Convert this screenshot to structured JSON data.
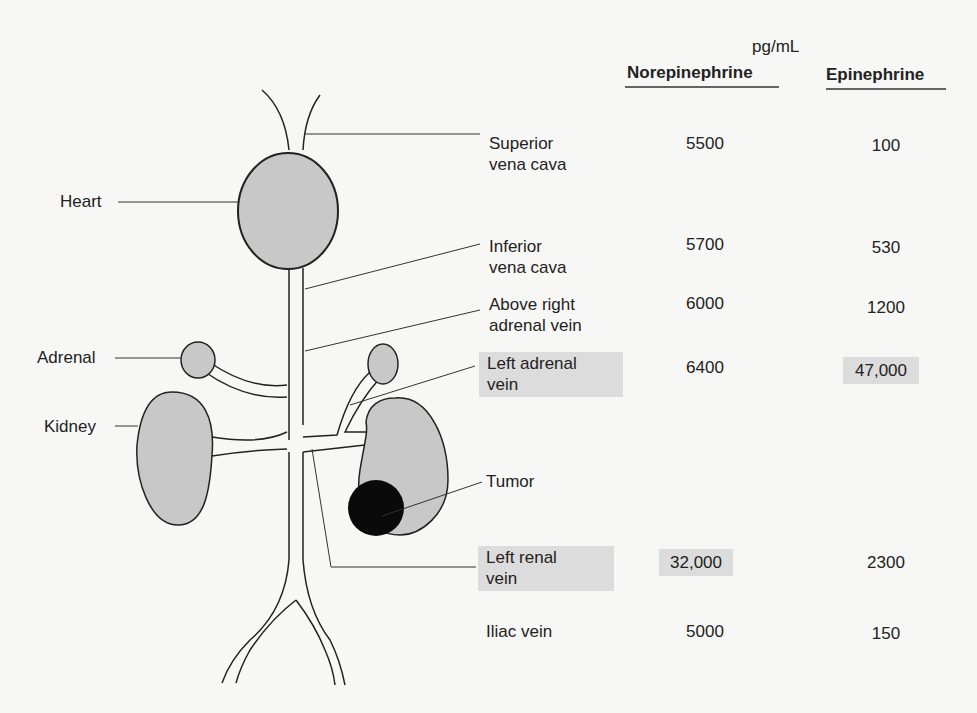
{
  "units": "pg/mL",
  "columns": [
    "Norepinephrine",
    "Epinephrine"
  ],
  "organ_labels": {
    "heart": "Heart",
    "adrenal": "Adrenal",
    "kidney": "Kidney",
    "tumor": "Tumor"
  },
  "rows": [
    {
      "site": "Superior vena cava",
      "site_l1": "Superior",
      "site_l2": "vena cava",
      "norepinephrine": "5500",
      "epinephrine": "100",
      "highlight_site": false,
      "highlight_ne": false,
      "highlight_epi": false
    },
    {
      "site": "Inferior vena cava",
      "site_l1": "Inferior",
      "site_l2": "vena cava",
      "norepinephrine": "5700",
      "epinephrine": "530",
      "highlight_site": false,
      "highlight_ne": false,
      "highlight_epi": false
    },
    {
      "site": "Above right adrenal vein",
      "site_l1": "Above right",
      "site_l2": "adrenal vein",
      "norepinephrine": "6000",
      "epinephrine": "1200",
      "highlight_site": false,
      "highlight_ne": false,
      "highlight_epi": false
    },
    {
      "site": "Left adrenal vein",
      "site_l1": "Left adrenal",
      "site_l2": "vein",
      "norepinephrine": "6400",
      "epinephrine": "47,000",
      "highlight_site": true,
      "highlight_ne": false,
      "highlight_epi": true
    },
    {
      "site": "Left renal vein",
      "site_l1": "Left renal",
      "site_l2": "vein",
      "norepinephrine": "32,000",
      "epinephrine": "2300",
      "highlight_site": true,
      "highlight_ne": true,
      "highlight_epi": false
    },
    {
      "site": "Iliac vein",
      "site_l1": "Iliac vein",
      "site_l2": "",
      "norepinephrine": "5000",
      "epinephrine": "150",
      "highlight_site": false,
      "highlight_ne": false,
      "highlight_epi": false
    }
  ],
  "colors": {
    "organ_fill": "#c8c8c8",
    "tumor_fill": "#0a0a0a",
    "highlight": "#dcdcdc",
    "line": "#222222"
  }
}
